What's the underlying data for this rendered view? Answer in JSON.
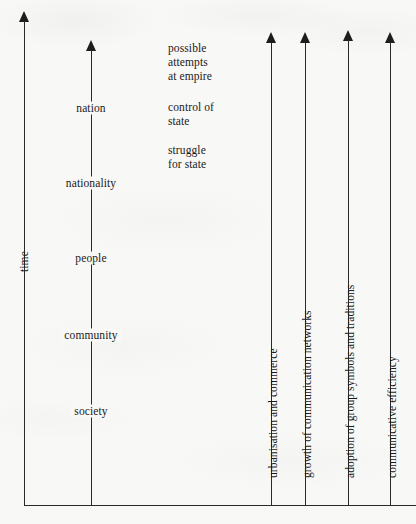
{
  "figure": {
    "type": "diagram",
    "time_axis": {
      "label": "time",
      "direction": "upward"
    },
    "stage_axis": {
      "label": "stages of group formation",
      "direction": "upward",
      "stages_bottom_to_top": [
        "society",
        "community",
        "people",
        "nationality",
        "nation"
      ]
    },
    "stages": [
      {
        "label": "nation",
        "x": 91,
        "y": 108
      },
      {
        "label": "nationality",
        "x": 91,
        "y": 183
      },
      {
        "label": "people",
        "x": 91,
        "y": 258
      },
      {
        "label": "community",
        "x": 91,
        "y": 335
      },
      {
        "label": "society",
        "x": 91,
        "y": 411
      }
    ],
    "annotations": [
      {
        "text": "possible\nattempts\nat empire",
        "x": 168,
        "y": 41
      },
      {
        "text": "control of\nstate",
        "x": 168,
        "y": 100
      },
      {
        "text": "struggle\nfor state",
        "x": 168,
        "y": 143
      }
    ],
    "drivers": [
      {
        "label": "urbanisation and commerce",
        "x": 271
      },
      {
        "label": "growth of communication networks",
        "x": 305
      },
      {
        "label": "adoption of group symbols and traditions",
        "x": 348
      },
      {
        "label": "communicative efficiency",
        "x": 390
      }
    ],
    "colors": {
      "ink": "#1d1d1d",
      "line": "#2a2a2a",
      "paper": "#f8f8f6"
    }
  }
}
